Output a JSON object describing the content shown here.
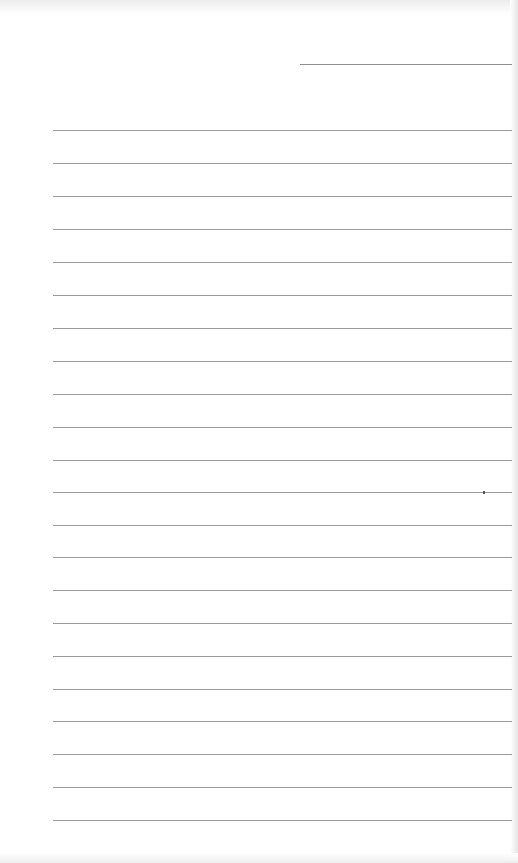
{
  "page": {
    "type": "blank ruled sheet",
    "header_line": {
      "x_start": 300,
      "x_end": 512,
      "y": 64
    },
    "ruled_lines": {
      "count": 22,
      "x_start": 53,
      "x_end": 512,
      "y_positions": [
        130,
        163,
        196,
        229,
        262,
        295,
        328,
        361,
        394,
        427,
        460,
        492,
        525,
        557,
        590,
        623,
        656,
        689,
        721,
        754,
        787,
        820
      ]
    },
    "colors": {
      "paper": "#ffffff",
      "line": "#9a9a9a"
    }
  }
}
